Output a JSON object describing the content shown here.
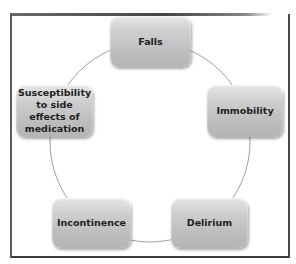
{
  "diagram": {
    "type": "cycle",
    "nodes": [
      {
        "id": "falls",
        "label": "Falls"
      },
      {
        "id": "immobility",
        "label": "Immobility"
      },
      {
        "id": "delirium",
        "label": "Delirium"
      },
      {
        "id": "incontinence",
        "label": "Incontinence"
      },
      {
        "id": "susceptibility",
        "label": "Susceptibility to side effects of medication"
      }
    ],
    "colors": {
      "node_fill": "#c4c4c4",
      "ring": "#9a9a9a",
      "frame": "#4a4a4a",
      "text": "#1e1e1e"
    }
  }
}
